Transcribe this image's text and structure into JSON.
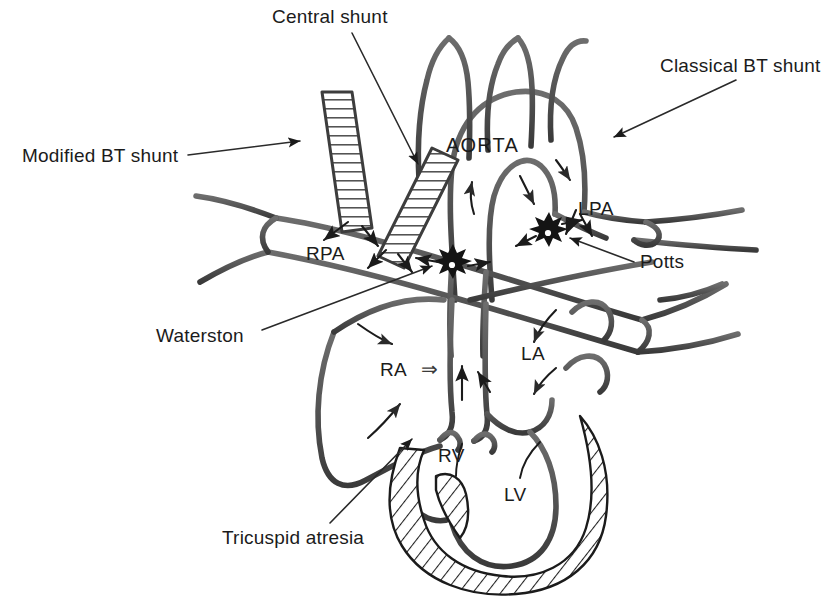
{
  "figure": {
    "kind": "medical-line-diagram",
    "background_color": "#ffffff",
    "ink_color": "#1b1b1b",
    "line_color": "#555555"
  },
  "callout_labels": {
    "central_shunt": "Central shunt",
    "classical_bt_shunt": "Classical BT shunt",
    "modified_bt_shunt": "Modified BT shunt",
    "potts": "Potts",
    "waterston": "Waterston",
    "tricuspid_atresia": "Tricuspid atresia"
  },
  "anatomy_labels": {
    "aorta": "AORTA",
    "rpa": "RPA",
    "lpa": "LPA",
    "ra": "RA",
    "la": "LA",
    "rv": "RV",
    "lv": "LV",
    "ra_flow_arrow": "⇒"
  },
  "legend_notes": {
    "graft_texture": "ladder-hatched tube graft",
    "muscle_texture": "diagonal hatch myocardium",
    "anastomosis_marker": "starburst"
  }
}
